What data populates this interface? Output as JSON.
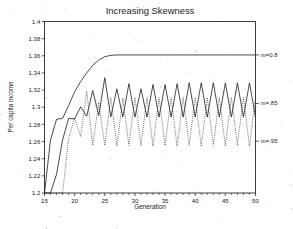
{
  "chart_data": {
    "type": "line",
    "title": "Increasing Skewness",
    "xlabel": "Generation",
    "ylabel": "Per capita income",
    "xlim": [
      15,
      50
    ],
    "ylim": [
      1.2,
      1.4
    ],
    "xticks": [
      15,
      20,
      25,
      30,
      35,
      40,
      45,
      50
    ],
    "xtick_labels": [
      "15",
      "20",
      "25",
      "30",
      "35",
      "40",
      "45",
      "50"
    ],
    "yticks": [
      1.2,
      1.22,
      1.24,
      1.26,
      1.28,
      1.3,
      1.32,
      1.34,
      1.36,
      1.38,
      1.4
    ],
    "ytick_labels": [
      "1.2",
      "1.22",
      "1.24",
      "1.26",
      "1.28",
      "1.3",
      "1.32",
      "1.34",
      "1.36",
      "1.38",
      "1.4"
    ],
    "grid": false,
    "legend_position": "right-outside-annotations",
    "x": [
      15,
      16,
      17,
      18,
      19,
      20,
      21,
      22,
      23,
      24,
      25,
      26,
      27,
      28,
      29,
      30,
      31,
      32,
      33,
      34,
      35,
      36,
      37,
      38,
      39,
      40,
      41,
      42,
      43,
      44,
      45,
      46,
      47,
      48,
      49,
      50
    ],
    "series": [
      {
        "name": "m=0.8",
        "style": "solid",
        "annotation": "m=0.8",
        "annotation_y": 1.361,
        "values": [
          1.2,
          1.262,
          1.286,
          1.287,
          1.302,
          1.318,
          1.33,
          1.34,
          1.349,
          1.355,
          1.359,
          1.3605,
          1.361,
          1.361,
          1.361,
          1.361,
          1.361,
          1.361,
          1.361,
          1.361,
          1.361,
          1.361,
          1.361,
          1.361,
          1.361,
          1.361,
          1.361,
          1.361,
          1.361,
          1.361,
          1.361,
          1.361,
          1.361,
          1.361,
          1.361,
          1.361
        ]
      },
      {
        "name": "m=.85",
        "style": "solid",
        "annotation": "m=.85",
        "annotation_y": 1.3045,
        "values": [
          1.2,
          1.2,
          1.222,
          1.262,
          1.287,
          1.2865,
          1.3005,
          1.2895,
          1.3195,
          1.2905,
          1.3345,
          1.2885,
          1.3215,
          1.2885,
          1.3275,
          1.2885,
          1.3215,
          1.2885,
          1.3265,
          1.2885,
          1.3265,
          1.2885,
          1.3275,
          1.2885,
          1.3285,
          1.2885,
          1.3285,
          1.2885,
          1.3285,
          1.2885,
          1.3285,
          1.2885,
          1.3285,
          1.2885,
          1.3285,
          1.2885
        ]
      },
      {
        "name": "m=.95",
        "style": "dotted",
        "annotation": "m=.95",
        "annotation_y": 1.2605,
        "values": [
          1.2,
          1.2,
          1.2,
          1.2,
          1.2635,
          1.2875,
          1.2655,
          1.3185,
          1.2555,
          1.3055,
          1.2555,
          1.3115,
          1.2545,
          1.3105,
          1.2555,
          1.3115,
          1.2555,
          1.3115,
          1.2545,
          1.3115,
          1.2555,
          1.3115,
          1.2545,
          1.3115,
          1.2555,
          1.3115,
          1.2545,
          1.3115,
          1.2555,
          1.3115,
          1.2545,
          1.3115,
          1.2555,
          1.3115,
          1.2545,
          1.3115
        ]
      }
    ],
    "annotations": [
      {
        "text": "m=0.8",
        "y": 1.361
      },
      {
        "text": "m=.85",
        "y": 1.3045
      },
      {
        "text": "m=.95",
        "y": 1.2605
      }
    ]
  }
}
